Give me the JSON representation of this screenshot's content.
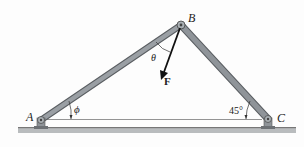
{
  "diagram": {
    "points": {
      "A": {
        "label": "A",
        "x": 41,
        "y": 120
      },
      "B": {
        "label": "B",
        "x": 181,
        "y": 25
      },
      "C": {
        "label": "C",
        "x": 268,
        "y": 119
      }
    },
    "force": {
      "label": "F",
      "from": [
        181,
        25
      ],
      "to": [
        162,
        78
      ]
    },
    "angles": {
      "theta": {
        "label": "θ"
      },
      "phi": {
        "label": "ϕ"
      },
      "angle_c": {
        "label": "45°"
      }
    },
    "colors": {
      "member_fill": "#8f9499",
      "member_edge": "#5a5e62",
      "ground": "#b9bcbe",
      "arrow": "#111111"
    }
  }
}
